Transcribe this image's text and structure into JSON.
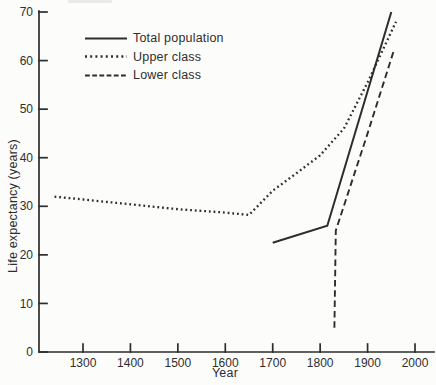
{
  "chart_data": {
    "type": "line",
    "title": "",
    "xlabel": "Year",
    "ylabel": "Life expectancy (years)",
    "xlim": [
      1207,
      2040
    ],
    "ylim": [
      0,
      70
    ],
    "grid": false,
    "legend_position": "top-left-inside",
    "x_ticks": [
      1300,
      1400,
      1500,
      1600,
      1700,
      1800,
      1900,
      2000
    ],
    "y_ticks": [
      0,
      10,
      20,
      30,
      40,
      50,
      60,
      70
    ],
    "series": [
      {
        "name": "Total population",
        "style": "solid",
        "points": [
          [
            1700,
            22.5
          ],
          [
            1815,
            26
          ],
          [
            1950,
            70
          ]
        ]
      },
      {
        "name": "Upper class",
        "style": "dotted",
        "points": [
          [
            1240,
            32
          ],
          [
            1300,
            31.4
          ],
          [
            1400,
            30.4
          ],
          [
            1500,
            29.4
          ],
          [
            1600,
            28.7
          ],
          [
            1650,
            28.2
          ],
          [
            1700,
            33.2
          ],
          [
            1750,
            36.8
          ],
          [
            1800,
            40.5
          ],
          [
            1850,
            46
          ],
          [
            1900,
            55.5
          ],
          [
            1960,
            68
          ]
        ]
      },
      {
        "name": "Lower class",
        "style": "dashed",
        "points": [
          [
            1830,
            5
          ],
          [
            1833,
            25
          ],
          [
            1900,
            45
          ],
          [
            1955,
            62
          ]
        ]
      }
    ]
  },
  "colors": {
    "ink": "#2d2d2d",
    "text": "#2e2e2e",
    "background": "#fcfcfb"
  }
}
